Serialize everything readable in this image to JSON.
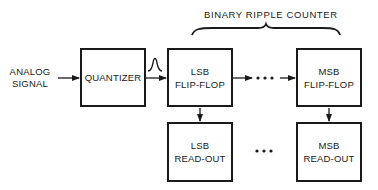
{
  "diagram": {
    "type": "block-diagram",
    "title": "BINARY RIPPLE COUNTER",
    "input": {
      "line1": "ANALOG",
      "line2": "SIGNAL"
    },
    "blocks": {
      "quantizer": {
        "label": "QUANTIZER"
      },
      "lsb_flipflop": {
        "line1": "LSB",
        "line2": "FLIP-FLOP"
      },
      "msb_flipflop": {
        "line1": "MSB",
        "line2": "FLIP-FLOP"
      },
      "lsb_readout": {
        "line1": "LSB",
        "line2": "READ-OUT"
      },
      "msb_readout": {
        "line1": "MSB",
        "line2": "READ-OUT"
      }
    },
    "ellipsis": "• • •",
    "pulse_icon": "pulse-waveform",
    "edges": [
      {
        "from": "analog-signal",
        "to": "quantizer"
      },
      {
        "from": "quantizer",
        "to": "lsb_flipflop",
        "annotation": "pulse"
      },
      {
        "from": "lsb_flipflop",
        "to": "msb_flipflop",
        "via": "ellipsis"
      },
      {
        "from": "lsb_flipflop",
        "to": "lsb_readout"
      },
      {
        "from": "msb_flipflop",
        "to": "msb_readout"
      }
    ],
    "brace_spans": [
      "lsb_flipflop",
      "msb_flipflop"
    ],
    "colors": {
      "ink": "#1a1a1a",
      "background": "#ffffff"
    }
  }
}
